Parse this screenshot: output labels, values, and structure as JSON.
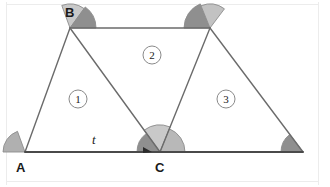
{
  "figure": {
    "type": "geometry-diagram",
    "background_color": "#ffffff",
    "frame_color": "#ececec",
    "line_color": "#6b6b6b",
    "base_line_color": "#4a4a4a",
    "arc_outline_color": "#8c8c8c"
  },
  "vertices": [
    {
      "name": "A",
      "label": "A",
      "x": 25,
      "y": 152,
      "label_x": 16,
      "label_y": 172
    },
    {
      "name": "B",
      "label": "B",
      "x": 70,
      "y": 28,
      "label_x": 65,
      "label_y": 17
    },
    {
      "name": "C",
      "label": "C",
      "x": 160,
      "y": 152,
      "label_x": 155,
      "label_y": 172
    },
    {
      "name": "D",
      "label": "",
      "x": 210,
      "y": 28,
      "label_x": 0,
      "label_y": 0
    },
    {
      "name": "E",
      "label": "",
      "x": 303,
      "y": 152,
      "label_x": 0,
      "label_y": 0
    }
  ],
  "segments": [
    {
      "name": "segment-AB",
      "x1": 25,
      "y1": 152,
      "x2": 70,
      "y2": 28
    },
    {
      "name": "segment-BC",
      "x1": 70,
      "y1": 28,
      "x2": 160,
      "y2": 152
    },
    {
      "name": "segment-BD-top",
      "x1": 70,
      "y1": 28,
      "x2": 210,
      "y2": 28
    },
    {
      "name": "segment-CD",
      "x1": 160,
      "y1": 152,
      "x2": 210,
      "y2": 28
    },
    {
      "name": "segment-DE",
      "x1": 210,
      "y1": 28,
      "x2": 303,
      "y2": 152
    },
    {
      "name": "segment-base-AE",
      "x1": 25,
      "y1": 152,
      "x2": 303,
      "y2": 152
    }
  ],
  "line_label": {
    "text": "t",
    "x": 92,
    "y": 144
  },
  "arrow_marker": {
    "name": "direction-arrow",
    "x": 152,
    "y": 152,
    "color": "#2b2b2b"
  },
  "angle_arcs": [
    {
      "name": "angle-at-A",
      "vertex": "A",
      "cx": 25,
      "cy": 152,
      "r": 22,
      "start_deg": 180,
      "end_deg": 110,
      "fill": "#b0b0b0"
    },
    {
      "name": "angle-at-B-left-ABC",
      "vertex": "B",
      "cx": 70,
      "cy": 28,
      "r": 24,
      "start_deg": 110,
      "end_deg": 54,
      "fill": "#c9c9c9"
    },
    {
      "name": "angle-at-B-right-DBC",
      "vertex": "B",
      "cx": 70,
      "cy": 28,
      "r": 26,
      "start_deg": 54,
      "end_deg": 0,
      "fill": "#8f8f8f"
    },
    {
      "name": "angle-at-C-left-BCA",
      "vertex": "C",
      "cx": 160,
      "cy": 152,
      "r": 23,
      "start_deg": 180,
      "end_deg": 126,
      "fill": "#8f8f8f"
    },
    {
      "name": "angle-at-C-middle-BCD",
      "vertex": "C",
      "cx": 160,
      "cy": 152,
      "r": 27,
      "start_deg": 126,
      "end_deg": 68,
      "fill": "#c9c9c9"
    },
    {
      "name": "angle-at-C-right-DCE",
      "vertex": "C",
      "cx": 160,
      "cy": 152,
      "r": 25,
      "start_deg": 68,
      "end_deg": 0,
      "fill": "#b8b8b8"
    },
    {
      "name": "angle-at-D-left-BDC",
      "vertex": "D",
      "cx": 210,
      "cy": 28,
      "r": 26,
      "start_deg": 180,
      "end_deg": 112,
      "fill": "#8f8f8f"
    },
    {
      "name": "angle-at-D-right-CDE",
      "vertex": "D",
      "cx": 210,
      "cy": 28,
      "r": 24,
      "start_deg": 112,
      "end_deg": 53,
      "fill": "#c2c2c2"
    },
    {
      "name": "angle-at-E",
      "vertex": "E",
      "cx": 303,
      "cy": 152,
      "r": 22,
      "start_deg": 180,
      "end_deg": 127,
      "fill": "#8f8f8f"
    }
  ],
  "region_labels": [
    {
      "name": "region-1",
      "text": "1",
      "cx": 78,
      "cy": 99,
      "r": 9
    },
    {
      "name": "region-2",
      "text": "2",
      "cx": 152,
      "cy": 55,
      "r": 9
    },
    {
      "name": "region-3",
      "text": "3",
      "cx": 226,
      "cy": 99,
      "r": 9
    }
  ]
}
